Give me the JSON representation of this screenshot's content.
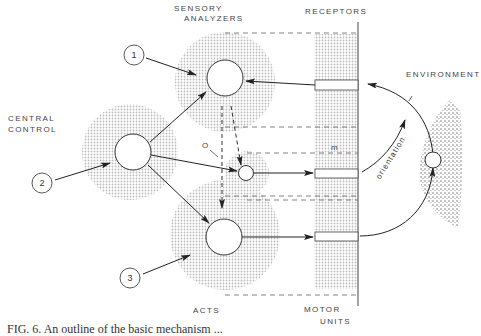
{
  "labels": {
    "sensory_analyzers_line1": "SENSORY",
    "sensory_analyzers_line2": "ANALYZERS",
    "receptors": "RECEPTORS",
    "central_control_line1": "CENTRAL",
    "central_control_line2": "CONTROL",
    "environment": "ENVIRONMENT",
    "acts": "ACTS",
    "motor_units_line1": "MOTOR",
    "motor_units_line2": "UNITS",
    "orientation": "orientation",
    "o_marker": "O",
    "m_marker": "m"
  },
  "inputs": [
    {
      "id": 1,
      "label": "1"
    },
    {
      "id": 2,
      "label": "2"
    },
    {
      "id": 3,
      "label": "3"
    }
  ],
  "caption": "FIG. 6. An outline of the basic mechanism ...",
  "colors": {
    "stipple": "#d9d9d9",
    "line": "#333333",
    "text": "#444444"
  }
}
